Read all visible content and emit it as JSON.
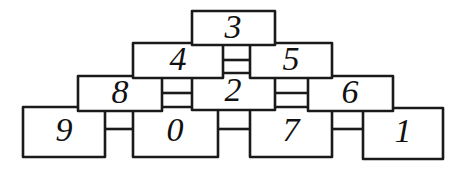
{
  "diagram": {
    "canvas": {
      "width": 465,
      "height": 173,
      "background": "#ffffff"
    },
    "stroke_color": "#1a1a1a",
    "text_color": "#111111",
    "rows": [
      {
        "row": 0,
        "labels": [
          "3"
        ]
      },
      {
        "row": 1,
        "labels": [
          "4",
          "5"
        ]
      },
      {
        "row": 2,
        "labels": [
          "8",
          "2",
          "6"
        ]
      },
      {
        "row": 3,
        "labels": [
          "9",
          "0",
          "7",
          "1"
        ]
      }
    ],
    "nodes": [
      {
        "id": "n3",
        "label": "3",
        "row": 0,
        "x": 192,
        "y": 11,
        "w": 83,
        "h": 34
      },
      {
        "id": "n4",
        "label": "4",
        "row": 1,
        "x": 133,
        "y": 43,
        "w": 90,
        "h": 35
      },
      {
        "id": "n5",
        "label": "5",
        "row": 1,
        "x": 250,
        "y": 43,
        "w": 82,
        "h": 35
      },
      {
        "id": "n8",
        "label": "8",
        "row": 2,
        "x": 78,
        "y": 76,
        "w": 84,
        "h": 35
      },
      {
        "id": "n2",
        "label": "2",
        "row": 2,
        "x": 192,
        "y": 73,
        "w": 83,
        "h": 37
      },
      {
        "id": "n6",
        "label": "6",
        "row": 2,
        "x": 308,
        "y": 76,
        "w": 85,
        "h": 35
      },
      {
        "id": "n9",
        "label": "9",
        "row": 3,
        "x": 23,
        "y": 107,
        "w": 82,
        "h": 50
      },
      {
        "id": "n0",
        "label": "0",
        "row": 3,
        "x": 133,
        "y": 107,
        "w": 85,
        "h": 50
      },
      {
        "id": "n7",
        "label": "7",
        "row": 3,
        "x": 250,
        "y": 107,
        "w": 82,
        "h": 50
      },
      {
        "id": "n1",
        "label": "1",
        "row": 3,
        "x": 363,
        "y": 108,
        "w": 80,
        "h": 51
      }
    ],
    "links": [
      {
        "id": "l-9-0",
        "from": "n9",
        "to": "n0",
        "x1": 105,
        "x2": 133,
        "y": 129
      },
      {
        "id": "l-0-7",
        "from": "n0",
        "to": "n7",
        "x1": 218,
        "x2": 250,
        "y": 129
      },
      {
        "id": "l-7-1",
        "from": "n7",
        "to": "n1",
        "x1": 332,
        "x2": 363,
        "y": 129
      },
      {
        "id": "l-8-2",
        "from": "n8",
        "to": "n2",
        "x1": 162,
        "x2": 192,
        "y": 93
      },
      {
        "id": "l-2-6",
        "from": "n2",
        "to": "n6",
        "x1": 275,
        "x2": 308,
        "y": 93
      },
      {
        "id": "l-4-5",
        "from": "n4",
        "to": "n5",
        "x1": 223,
        "x2": 250,
        "y": 60
      }
    ]
  }
}
